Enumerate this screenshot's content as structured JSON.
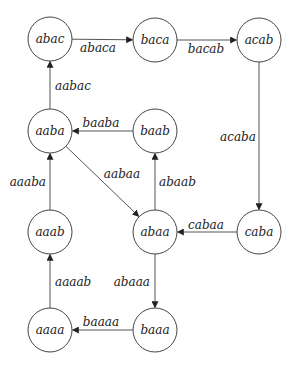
{
  "diagram": {
    "type": "directed-graph",
    "node_radius": 22,
    "colors": {
      "stroke": "#444444",
      "text": "#222222",
      "background": "#ffffff"
    },
    "nodes": [
      {
        "id": "abac",
        "label": "abac",
        "x": 50,
        "y": 39
      },
      {
        "id": "baca",
        "label": "baca",
        "x": 155,
        "y": 40
      },
      {
        "id": "acab",
        "label": "acab",
        "x": 259,
        "y": 40
      },
      {
        "id": "aaba",
        "label": "aaba",
        "x": 50,
        "y": 131
      },
      {
        "id": "baab",
        "label": "baab",
        "x": 155,
        "y": 131
      },
      {
        "id": "aaab",
        "label": "aaab",
        "x": 50,
        "y": 232
      },
      {
        "id": "abaa",
        "label": "abaa",
        "x": 155,
        "y": 232
      },
      {
        "id": "caba",
        "label": "caba",
        "x": 259,
        "y": 232
      },
      {
        "id": "aaaa",
        "label": "aaaa",
        "x": 50,
        "y": 330
      },
      {
        "id": "baaa",
        "label": "baaa",
        "x": 155,
        "y": 330
      }
    ],
    "edges": [
      {
        "from": "abac",
        "to": "baca",
        "label": "abaca",
        "lx": 98,
        "ly": 52,
        "anchor": "middle"
      },
      {
        "from": "baca",
        "to": "acab",
        "label": "bacab",
        "lx": 206,
        "ly": 53,
        "anchor": "middle"
      },
      {
        "from": "aaba",
        "to": "abac",
        "label": "aabac",
        "lx": 55,
        "ly": 90,
        "anchor": "start"
      },
      {
        "from": "baab",
        "to": "aaba",
        "label": "baaba",
        "lx": 101,
        "ly": 127,
        "anchor": "middle"
      },
      {
        "from": "aaba",
        "to": "abaa",
        "label": "aabaa",
        "lx": 122,
        "ly": 178,
        "anchor": "middle"
      },
      {
        "from": "abaa",
        "to": "baab",
        "label": "abaab",
        "lx": 159,
        "ly": 186,
        "anchor": "start"
      },
      {
        "from": "acab",
        "to": "caba",
        "label": "acaba",
        "lx": 238,
        "ly": 141,
        "anchor": "middle"
      },
      {
        "from": "caba",
        "to": "abaa",
        "label": "cabaa",
        "lx": 206,
        "ly": 229,
        "anchor": "middle"
      },
      {
        "from": "aaab",
        "to": "aaba",
        "label": "aaaba",
        "lx": 46,
        "ly": 186,
        "anchor": "end"
      },
      {
        "from": "abaa",
        "to": "baaa",
        "label": "abaaa",
        "lx": 150,
        "ly": 286,
        "anchor": "end"
      },
      {
        "from": "aaaa",
        "to": "aaab",
        "label": "aaaab",
        "lx": 55,
        "ly": 286,
        "anchor": "start"
      },
      {
        "from": "baaa",
        "to": "aaaa",
        "label": "baaaa",
        "lx": 101,
        "ly": 326,
        "anchor": "middle"
      }
    ]
  }
}
